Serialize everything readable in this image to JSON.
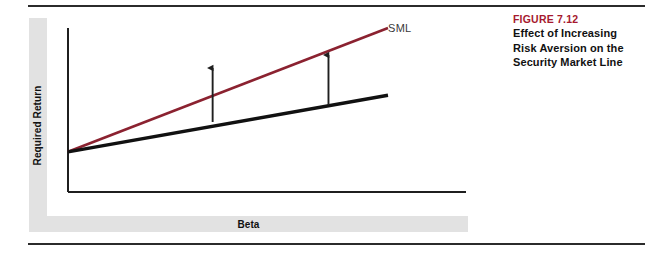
{
  "figure": {
    "number_label": "FIGURE 7.12",
    "caption_lines": [
      "Effect of Increasing",
      "Risk Aversion on the",
      "Security Market Line"
    ],
    "accent_color": "#a6192e"
  },
  "chart_data": {
    "type": "line",
    "title": "Effect of Increasing Risk Aversion on the Security Market Line",
    "xlabel": "Beta",
    "ylabel": "Required Return",
    "grid": false,
    "legend": "inline-label",
    "axis_style": "unlabeled-schematic",
    "xlim": [
      0,
      1
    ],
    "ylim": [
      0,
      1
    ],
    "series": [
      {
        "name": "SML",
        "role": "new-steeper-sml",
        "color": "#8b2230",
        "label": "SML",
        "label_position": "right-end",
        "points": [
          {
            "x": 0.0,
            "y": 0.245
          },
          {
            "x": 1.0,
            "y": 1.0
          }
        ]
      },
      {
        "name": "Original SML",
        "role": "original-sml",
        "color": "#111111",
        "label": "",
        "points": [
          {
            "x": 0.0,
            "y": 0.245
          },
          {
            "x": 1.0,
            "y": 0.59
          }
        ]
      }
    ],
    "annotations": [
      {
        "type": "arrow",
        "direction": "up",
        "meaning": "increase-in-required-return",
        "x": 0.452,
        "y_start": 0.427,
        "y_end": 0.756
      },
      {
        "type": "arrow",
        "direction": "up",
        "meaning": "increase-in-required-return",
        "x": 0.814,
        "y_start": 0.53,
        "y_end": 0.835
      }
    ],
    "colors": {
      "sml_new": "#8b2230",
      "sml_original": "#111111",
      "axis": "#1f1f1f",
      "band": "#e2e2e2",
      "rule": "#2b2b2b"
    }
  }
}
